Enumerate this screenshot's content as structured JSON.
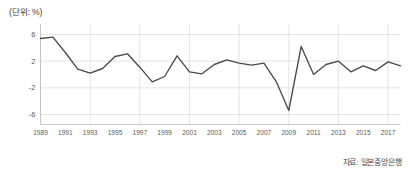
{
  "chart_data": {
    "type": "line",
    "title": "",
    "unit_note": "(단위: %)",
    "source_note": "자료: 일본중앙은행",
    "xlabel": "",
    "ylabel": "",
    "grid": true,
    "legend": "none",
    "xlim": [
      1989,
      2018
    ],
    "ylim": [
      -7.5,
      7.5
    ],
    "yticks": [
      "6",
      "2",
      "-2",
      "-6"
    ],
    "ytick_values": [
      6,
      2,
      -2,
      -6
    ],
    "xticks": [
      "1989",
      "1991",
      "1993",
      "1995",
      "1997",
      "1999",
      "2001",
      "2003",
      "2005",
      "2007",
      "2009",
      "2011",
      "2013",
      "2015",
      "2017"
    ],
    "xtick_values": [
      1989,
      1991,
      1993,
      1995,
      1997,
      1999,
      2001,
      2003,
      2005,
      2007,
      2009,
      2011,
      2013,
      2015,
      2017
    ],
    "x": [
      1989,
      1990,
      1991,
      1992,
      1993,
      1994,
      1995,
      1996,
      1997,
      1998,
      1999,
      2000,
      2001,
      2002,
      2003,
      2004,
      2005,
      2006,
      2007,
      2008,
      2009,
      2010,
      2011,
      2012,
      2013,
      2014,
      2015,
      2016,
      2017,
      2018
    ],
    "series": [
      {
        "name": "실질 GDP 성장률",
        "color": "#4a4a4a",
        "values": [
          5.4,
          5.6,
          3.3,
          0.8,
          0.2,
          0.9,
          2.7,
          3.1,
          1.1,
          -1.1,
          -0.3,
          2.8,
          0.4,
          0.1,
          1.5,
          2.2,
          1.7,
          1.4,
          1.7,
          -1.1,
          -5.4,
          4.2,
          0.0,
          1.5,
          2.0,
          0.4,
          1.3,
          0.6,
          1.9,
          1.3
        ]
      }
    ]
  }
}
